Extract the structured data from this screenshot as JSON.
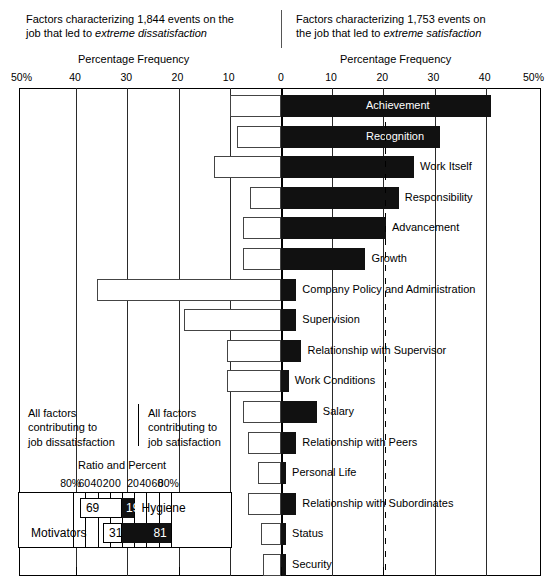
{
  "header": {
    "left_line1": "Factors characterizing 1,844 events on the",
    "left_line2_plain": "job that led to ",
    "left_line2_italic": "extreme dissatisfaction",
    "right_line1": "Factors characterizing 1,753 events on",
    "right_line2_plain": "the job that led to ",
    "right_line2_italic": "extreme satisfaction",
    "axis_title_left": "Percentage Frequency",
    "axis_title_right": "Percentage Frequency"
  },
  "axis": {
    "tick_labels": [
      "50%",
      "40",
      "30",
      "20",
      "10",
      "0",
      "10",
      "20",
      "30",
      "40",
      "50%"
    ],
    "tick_values": [
      -50,
      -40,
      -30,
      -20,
      -10,
      0,
      10,
      20,
      30,
      40,
      50
    ],
    "zero_value": 0,
    "range": [
      -50,
      50
    ]
  },
  "captions": {
    "left_line1": "All factors",
    "left_line2": "contributing to",
    "left_line3": "job dissatisfaction",
    "right_line1": "All factors",
    "right_line2": "contributing to",
    "right_line3": "job satisfaction"
  },
  "inset": {
    "title": "Ratio and Percent",
    "tick_labels": [
      "80%",
      "60",
      "40",
      "20",
      "0",
      "20",
      "40",
      "60",
      "80%"
    ],
    "tick_values": [
      -80,
      -60,
      -40,
      -20,
      0,
      20,
      40,
      60,
      80
    ],
    "rows": [
      {
        "name": "Hygiene",
        "label": "Hygiene",
        "label_side": "right",
        "dissatisfaction": 69,
        "satisfaction": 19,
        "neg_text": "69",
        "pos_text": "19"
      },
      {
        "name": "Motivators",
        "label": "Motivators",
        "label_side": "left",
        "dissatisfaction": 31,
        "satisfaction": 81,
        "neg_text": "31",
        "pos_text": "81"
      }
    ]
  },
  "chart_data": {
    "type": "bar",
    "xlabel": "Percentage Frequency",
    "ylabel": "",
    "xlim": [
      -50,
      50
    ],
    "grid": true,
    "legend_position": "none",
    "orientation": "horizontal",
    "categories": [
      "Achievement",
      "Recognition",
      "Work Itself",
      "Responsibility",
      "Advancement",
      "Growth",
      "Company Policy and Administration",
      "Supervision",
      "Relationship with Supervisor",
      "Work Conditions",
      "Salary",
      "Relationship with Peers",
      "Personal Life",
      "Relationship with Subordinates",
      "Status",
      "Security"
    ],
    "series": [
      {
        "name": "Percentage frequency low (dissatisfaction)",
        "color": "#ffffff",
        "values": [
          -10.0,
          -8.5,
          -13.0,
          -6.0,
          -7.5,
          -7.5,
          -36.0,
          -19.0,
          -10.5,
          -10.5,
          -7.5,
          -6.5,
          -4.5,
          -6.5,
          -4.0,
          -3.5
        ]
      },
      {
        "name": "Percentage frequency high (satisfaction)",
        "color": "#111111",
        "values": [
          41.0,
          31.0,
          26.0,
          23.0,
          20.5,
          16.5,
          3.0,
          3.0,
          4.0,
          1.5,
          7.0,
          3.0,
          1.0,
          3.0,
          1.0,
          1.0
        ]
      }
    ],
    "bars_on_label": [
      "Achievement",
      "Recognition"
    ]
  }
}
